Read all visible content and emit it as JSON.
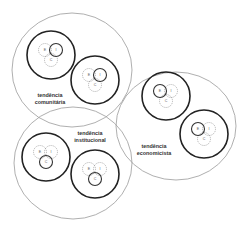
{
  "diagram": {
    "title": "",
    "colors": {
      "background": "#ffffff",
      "outer_stroke": "#9a9a9a",
      "group_stroke": "#222222",
      "solid_stroke": "#333333",
      "dashed_stroke": "#8a8a8a",
      "text": "#333333"
    },
    "tendencies": [
      {
        "id": "comunitaria",
        "label_line1": "tendência",
        "label_line2": "comunitária",
        "cx": 72,
        "cy": 70,
        "rx": 60,
        "ry": 57,
        "label_x": 50,
        "label_y": 97,
        "emphasis": "I",
        "groups": [
          {
            "cx": 51,
            "cy": 55,
            "r": 24
          },
          {
            "cx": 95,
            "cy": 80,
            "r": 24
          }
        ]
      },
      {
        "id": "institucional",
        "label_line1": "tendência",
        "label_line2": "institucional",
        "cx": 73,
        "cy": 163,
        "rx": 59,
        "ry": 56,
        "label_x": 90,
        "label_y": 135,
        "emphasis": "C",
        "groups": [
          {
            "cx": 46,
            "cy": 157,
            "r": 24
          },
          {
            "cx": 95,
            "cy": 174,
            "r": 24
          }
        ]
      },
      {
        "id": "economicista",
        "label_line1": "tendência",
        "label_line2": "economicista",
        "cx": 176,
        "cy": 126,
        "rx": 60,
        "ry": 54,
        "label_x": 154,
        "label_y": 148,
        "emphasis": "E",
        "groups": [
          {
            "cx": 166,
            "cy": 96,
            "r": 24
          },
          {
            "cx": 204,
            "cy": 134,
            "r": 24
          }
        ]
      }
    ],
    "venn_letters": [
      "E",
      "I",
      "C"
    ],
    "venn_offsets": {
      "E": {
        "dx": -6,
        "dy": -5
      },
      "I": {
        "dx": 5,
        "dy": -5
      },
      "C": {
        "dx": 0,
        "dy": 5
      }
    },
    "venn_radius": 6.5
  }
}
